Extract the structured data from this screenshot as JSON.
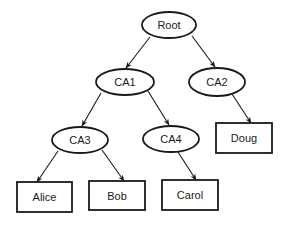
{
  "diagram": {
    "type": "tree",
    "colors": {
      "stroke": "#1a1a1a",
      "fill": "#ffffff",
      "text": "#1a1a1a",
      "background": "#ffffff"
    },
    "nodes": [
      {
        "id": "root",
        "label": "Root",
        "shape": "ellipse",
        "cx": 169,
        "cy": 25,
        "rx": 27,
        "ry": 13
      },
      {
        "id": "ca1",
        "label": "CA1",
        "shape": "ellipse",
        "cx": 125,
        "cy": 82,
        "rx": 29,
        "ry": 13
      },
      {
        "id": "ca2",
        "label": "CA2",
        "shape": "ellipse",
        "cx": 217,
        "cy": 82,
        "rx": 28,
        "ry": 14
      },
      {
        "id": "ca3",
        "label": "CA3",
        "shape": "ellipse",
        "cx": 80,
        "cy": 140,
        "rx": 28,
        "ry": 13
      },
      {
        "id": "ca4",
        "label": "CA4",
        "shape": "ellipse",
        "cx": 171,
        "cy": 139,
        "rx": 28,
        "ry": 13
      },
      {
        "id": "alice",
        "label": "Alice",
        "shape": "rect",
        "x": 17,
        "y": 182,
        "w": 55,
        "h": 30
      },
      {
        "id": "bob",
        "label": "Bob",
        "shape": "rect",
        "x": 89,
        "y": 181,
        "w": 56,
        "h": 29
      },
      {
        "id": "carol",
        "label": "Carol",
        "shape": "rect",
        "x": 162,
        "y": 180,
        "w": 56,
        "h": 30
      },
      {
        "id": "doug",
        "label": "Doug",
        "shape": "rect",
        "x": 216,
        "y": 123,
        "w": 56,
        "h": 30
      }
    ],
    "edges": [
      {
        "from": "root",
        "to": "ca1",
        "x1": 150,
        "y1": 37,
        "x2": 126,
        "y2": 68
      },
      {
        "from": "root",
        "to": "ca2",
        "x1": 192,
        "y1": 36,
        "x2": 215,
        "y2": 67
      },
      {
        "from": "ca1",
        "to": "ca3",
        "x1": 101,
        "y1": 93,
        "x2": 82,
        "y2": 126
      },
      {
        "from": "ca1",
        "to": "ca4",
        "x1": 148,
        "y1": 91,
        "x2": 169,
        "y2": 125
      },
      {
        "from": "ca2",
        "to": "doug",
        "x1": 232,
        "y1": 94,
        "x2": 251,
        "y2": 123
      },
      {
        "from": "ca3",
        "to": "alice",
        "x1": 58,
        "y1": 151,
        "x2": 37,
        "y2": 182
      },
      {
        "from": "ca3",
        "to": "bob",
        "x1": 102,
        "y1": 150,
        "x2": 124,
        "y2": 181
      },
      {
        "from": "ca4",
        "to": "carol",
        "x1": 178,
        "y1": 152,
        "x2": 196,
        "y2": 180
      }
    ]
  }
}
